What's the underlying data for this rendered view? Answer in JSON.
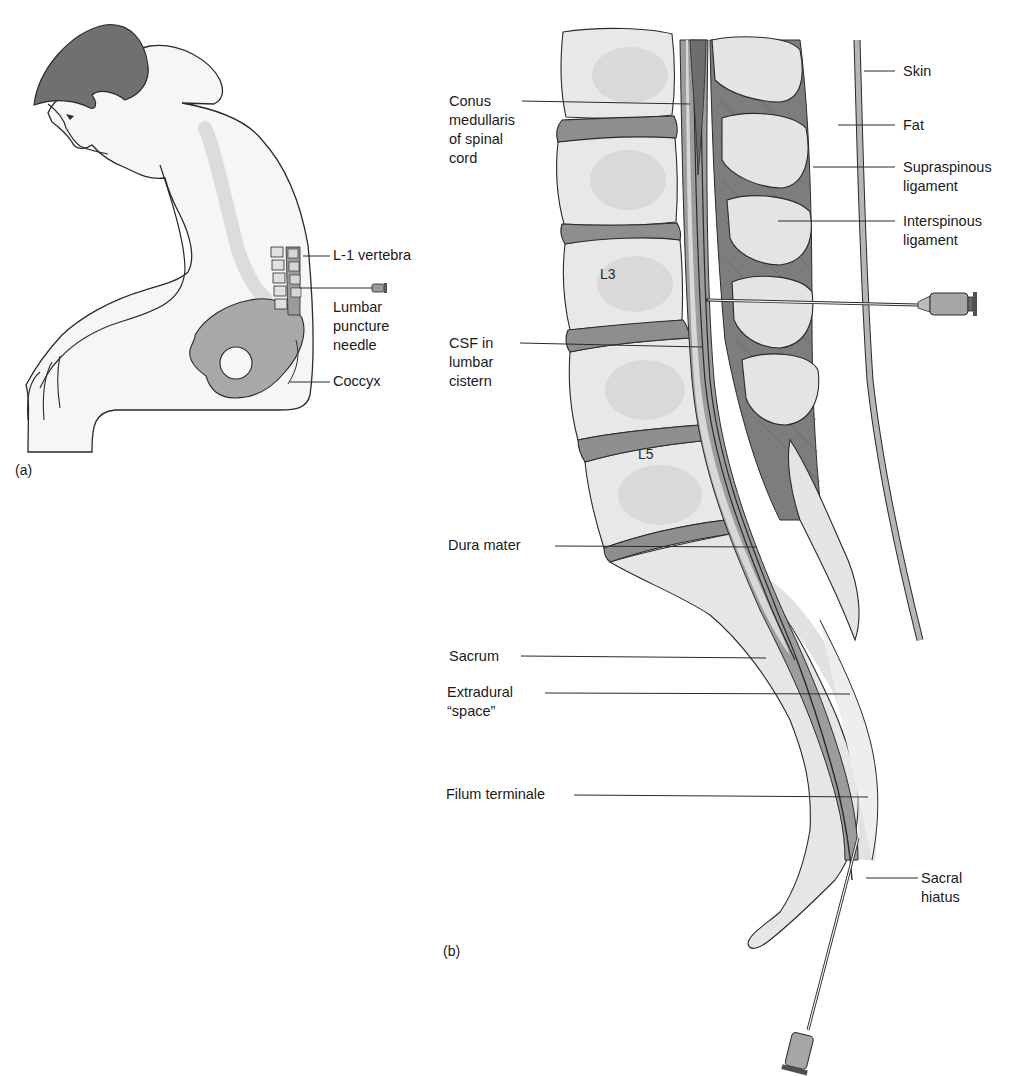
{
  "figure": {
    "panel_a": {
      "tag": "(a)",
      "labels": [
        {
          "id": "l1-vertebra",
          "lines": [
            "L-1 vertebra"
          ]
        },
        {
          "id": "lumbar-puncture-needle",
          "lines": [
            "Lumbar",
            "puncture",
            "needle"
          ]
        },
        {
          "id": "coccyx",
          "lines": [
            "Coccyx"
          ]
        }
      ]
    },
    "panel_b": {
      "tag": "(b)",
      "vertebra_labels": [
        "L3",
        "L5"
      ],
      "left_labels": [
        {
          "id": "conus-medullaris",
          "lines": [
            "Conus",
            "medullaris",
            "of spinal",
            "cord"
          ]
        },
        {
          "id": "csf-lumbar-cistern",
          "lines": [
            "CSF in",
            "lumbar",
            "cistern"
          ]
        },
        {
          "id": "dura-mater",
          "lines": [
            "Dura mater"
          ]
        },
        {
          "id": "sacrum",
          "lines": [
            "Sacrum"
          ]
        },
        {
          "id": "extradural-space",
          "lines": [
            "Extradural",
            "“space”"
          ]
        },
        {
          "id": "filum-terminale",
          "lines": [
            "Filum terminale"
          ]
        }
      ],
      "right_labels": [
        {
          "id": "skin",
          "lines": [
            "Skin"
          ]
        },
        {
          "id": "fat",
          "lines": [
            "Fat"
          ]
        },
        {
          "id": "supraspinous-ligament",
          "lines": [
            "Supraspinous",
            "ligament"
          ]
        },
        {
          "id": "interspinous-ligament",
          "lines": [
            "Interspinous",
            "ligament"
          ]
        },
        {
          "id": "sacral-hiatus",
          "lines": [
            "Sacral",
            "hiatus"
          ]
        }
      ]
    },
    "colors": {
      "outline": "#2a2a2a",
      "bone_light": "#e6e6e6",
      "bone_mid": "#d2d2d2",
      "disc": "#8c8c8c",
      "muscle": "#7a7a7a",
      "dura": "#9a9a9a",
      "hair": "#6e6e6e",
      "skin_body": "#f4f4f4",
      "pelvis": "#a0a0a0"
    }
  }
}
